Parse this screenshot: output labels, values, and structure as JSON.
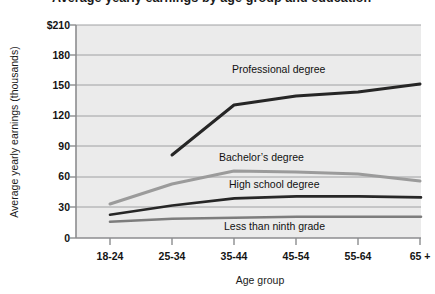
{
  "title_clipped": "Average yearly earnings by age group and education",
  "chart_data": {
    "type": "line",
    "title": "Average yearly earnings by age group and education",
    "xlabel": "Age group",
    "ylabel": "Average yearly earnings (thousands)",
    "categories": [
      "18-24",
      "25-34",
      "35-44",
      "45-54",
      "55-64",
      "65 +"
    ],
    "ylim": [
      0,
      210
    ],
    "yticks": [
      0,
      30,
      60,
      90,
      120,
      150,
      180,
      210
    ],
    "ytick_labels": [
      "0",
      "30",
      "60",
      "90",
      "120",
      "150",
      "180",
      "$210"
    ],
    "grid": true,
    "legend_position": "inline-labels",
    "series": [
      {
        "name": "Professional degree",
        "color": "#262626",
        "x": [
          "25-34",
          "35-44",
          "45-54",
          "55-64",
          "65 +"
        ],
        "values": [
          82,
          131,
          140,
          144,
          152
        ]
      },
      {
        "name": "Bachelor's degree",
        "color": "#9b9b9b",
        "x": [
          "18-24",
          "25-34",
          "35-44",
          "45-54",
          "55-64",
          "65 +"
        ],
        "values": [
          34,
          53,
          66,
          65,
          63,
          56
        ]
      },
      {
        "name": "High school degree",
        "color": "#262626",
        "x": [
          "18-24",
          "25-34",
          "35-44",
          "45-54",
          "55-64",
          "65 +"
        ],
        "values": [
          23,
          32,
          39,
          41,
          41,
          40
        ]
      },
      {
        "name": "Less than ninth grade",
        "color": "#7d7d7d",
        "x": [
          "18-24",
          "25-34",
          "35-44",
          "45-54",
          "55-64",
          "65 +"
        ],
        "values": [
          16,
          19,
          20,
          21,
          21,
          21
        ]
      }
    ]
  },
  "axis": {
    "y_title": "Average yearly earnings (thousands)",
    "x_title": "Age group",
    "y_ticks": [
      {
        "label": "$210"
      },
      {
        "label": "180"
      },
      {
        "label": "150"
      },
      {
        "label": "120"
      },
      {
        "label": "90"
      },
      {
        "label": "60"
      },
      {
        "label": "30"
      },
      {
        "label": "0"
      }
    ],
    "x_ticks": [
      {
        "label": "18-24"
      },
      {
        "label": "25-34"
      },
      {
        "label": "35-44"
      },
      {
        "label": "45-54"
      },
      {
        "label": "55-64"
      },
      {
        "label": "65 +"
      }
    ]
  },
  "series_labels": [
    {
      "text": "Professional degree"
    },
    {
      "text": "Bachelor’s degree"
    },
    {
      "text": "High school degree"
    },
    {
      "text": "Less than ninth grade"
    }
  ],
  "colors": {
    "plot_background": "#ebebeb",
    "gridline": "#9fa0a2",
    "axis": "#8c8d8f",
    "dark_series": "#262626",
    "light_series": "#9b9b9b",
    "mid_series": "#7d7d7d",
    "text": "#141414"
  }
}
